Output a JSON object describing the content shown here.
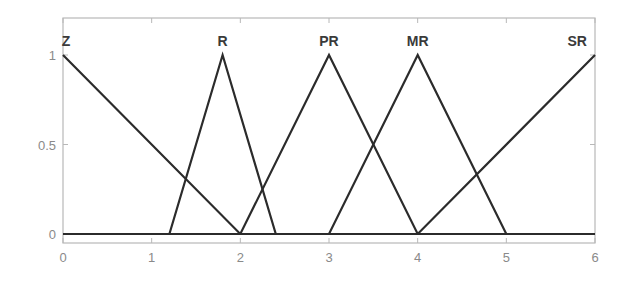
{
  "chart_data": {
    "type": "line",
    "title": "",
    "xlabel": "",
    "ylabel": "",
    "xlim": [
      0,
      6
    ],
    "ylim": [
      0,
      1.1
    ],
    "grid": false,
    "legend": "none",
    "x_ticks": [
      0,
      1,
      2,
      3,
      4,
      5,
      6
    ],
    "x_tick_labels": [
      "0",
      "1",
      "2",
      "3",
      "4",
      "5",
      "6"
    ],
    "y_ticks": [
      0,
      0.5,
      1
    ],
    "y_tick_labels": [
      "0",
      "0.5",
      "1"
    ],
    "line_color": "#2b2b2b",
    "series": [
      {
        "name": "Z",
        "x": [
          0,
          2,
          6
        ],
        "y": [
          1,
          0,
          0
        ]
      },
      {
        "name": "R",
        "x": [
          0,
          1.2,
          1.8,
          2.4,
          6
        ],
        "y": [
          0,
          0,
          1,
          0,
          0
        ]
      },
      {
        "name": "PR",
        "x": [
          0,
          2,
          3,
          4,
          6
        ],
        "y": [
          0,
          0,
          1,
          0,
          0
        ]
      },
      {
        "name": "MR",
        "x": [
          0,
          3,
          4,
          5,
          6
        ],
        "y": [
          0,
          0,
          1,
          0,
          0
        ]
      },
      {
        "name": "SR",
        "x": [
          0,
          4,
          6
        ],
        "y": [
          0,
          0,
          1
        ]
      }
    ],
    "annotations": [
      {
        "text": "Z",
        "x": 0,
        "y": 1.08
      },
      {
        "text": "R",
        "x": 1.8,
        "y": 1.08
      },
      {
        "text": "PR",
        "x": 3,
        "y": 1.08
      },
      {
        "text": "MR",
        "x": 4,
        "y": 1.08
      },
      {
        "text": "SR",
        "x": 5.8,
        "y": 1.08
      }
    ]
  }
}
